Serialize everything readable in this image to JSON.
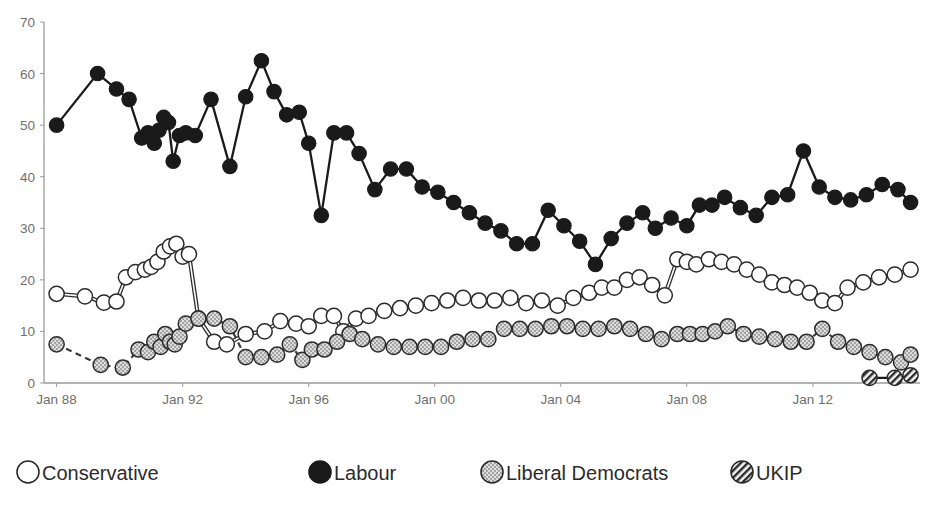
{
  "chart_data": {
    "type": "line",
    "title": "",
    "xlabel": "",
    "ylabel": "",
    "ylim": [
      0,
      70
    ],
    "ytick_labels": [
      "0",
      "10",
      "20",
      "30",
      "40",
      "50",
      "60",
      "70"
    ],
    "yticks": [
      0,
      10,
      20,
      30,
      40,
      50,
      60,
      70
    ],
    "xtick_labels": [
      "Jan 88",
      "Jan 92",
      "Jan 96",
      "Jan 00",
      "Jan 04",
      "Jan 08",
      "Jan 12"
    ],
    "xticks": [
      1988,
      1992,
      1996,
      2000,
      2004,
      2008,
      2012
    ],
    "xlim": [
      1987.6,
      2015.4
    ],
    "grid": false,
    "legend_position": "bottom",
    "series": [
      {
        "name": "Conservative",
        "marker": "open-circle",
        "line_style": "solid-double",
        "color": "#ffffff",
        "edge_color": "#2b2b2b",
        "x": [
          1988.0,
          1988.9,
          1989.5,
          1989.9,
          1990.2,
          1990.5,
          1990.8,
          1991.0,
          1991.2,
          1991.4,
          1991.6,
          1991.8,
          1992.0,
          1992.2,
          1992.5,
          1993.0,
          1993.4,
          1994.0,
          1994.6,
          1995.1,
          1995.6,
          1996.0,
          1996.4,
          1996.8,
          1997.1,
          1997.5,
          1997.9,
          1998.4,
          1998.9,
          1999.4,
          1999.9,
          2000.4,
          2000.9,
          2001.4,
          2001.9,
          2002.4,
          2002.9,
          2003.4,
          2003.9,
          2004.4,
          2004.9,
          2005.3,
          2005.7,
          2006.1,
          2006.5,
          2006.9,
          2007.3,
          2007.7,
          2008.0,
          2008.3,
          2008.7,
          2009.1,
          2009.5,
          2009.9,
          2010.3,
          2010.7,
          2011.1,
          2011.5,
          2011.9,
          2012.3,
          2012.7,
          2013.1,
          2013.6,
          2014.1,
          2014.6,
          2015.1
        ],
        "y": [
          17.3,
          16.8,
          15.6,
          15.8,
          20.5,
          21.5,
          22.0,
          22.5,
          23.5,
          25.5,
          26.5,
          27.0,
          24.5,
          25.0,
          12.5,
          8.0,
          7.5,
          9.5,
          10.0,
          12.0,
          11.5,
          11.0,
          13.0,
          13.0,
          10.0,
          12.5,
          13.0,
          14.0,
          14.5,
          15.0,
          15.5,
          16.0,
          16.5,
          16.0,
          16.0,
          16.5,
          15.5,
          16.0,
          15.0,
          16.5,
          17.5,
          18.5,
          18.5,
          20.0,
          20.5,
          19.0,
          17.0,
          24.0,
          23.5,
          23.0,
          24.0,
          23.5,
          23.0,
          22.0,
          21.0,
          19.5,
          19.0,
          18.5,
          17.5,
          16.0,
          15.5,
          18.5,
          19.5,
          20.5,
          21.0,
          22.0
        ]
      },
      {
        "name": "Labour",
        "marker": "filled-circle",
        "line_style": "solid",
        "color": "#1a1a1a",
        "edge_color": "#1a1a1a",
        "x": [
          1988.0,
          1989.3,
          1989.9,
          1990.3,
          1990.7,
          1990.9,
          1991.1,
          1991.25,
          1991.4,
          1991.55,
          1991.7,
          1991.9,
          1992.1,
          1992.4,
          1992.9,
          1993.5,
          1994.0,
          1994.5,
          1994.9,
          1995.3,
          1995.7,
          1996.0,
          1996.4,
          1996.8,
          1997.2,
          1997.6,
          1998.1,
          1998.6,
          1999.1,
          1999.6,
          2000.1,
          2000.6,
          2001.1,
          2001.6,
          2002.1,
          2002.6,
          2003.1,
          2003.6,
          2004.1,
          2004.6,
          2005.1,
          2005.6,
          2006.1,
          2006.6,
          2007.0,
          2007.5,
          2008.0,
          2008.4,
          2008.8,
          2009.2,
          2009.7,
          2010.2,
          2010.7,
          2011.2,
          2011.7,
          2012.2,
          2012.7,
          2013.2,
          2013.7,
          2014.2,
          2014.7,
          2015.1
        ],
        "y": [
          50.0,
          60.0,
          57.0,
          55.0,
          47.5,
          48.5,
          46.5,
          49.0,
          51.5,
          50.5,
          43.0,
          48.0,
          48.5,
          48.0,
          55.0,
          42.0,
          55.5,
          62.5,
          56.5,
          52.0,
          52.5,
          46.5,
          32.5,
          48.5,
          48.5,
          44.5,
          37.5,
          41.5,
          41.5,
          38.0,
          37.0,
          35.0,
          33.0,
          31.0,
          29.5,
          27.0,
          27.0,
          33.5,
          30.5,
          27.5,
          23.0,
          28.0,
          31.0,
          33.0,
          30.0,
          32.0,
          30.5,
          34.5,
          34.5,
          36.0,
          34.0,
          32.5,
          36.0,
          36.5,
          45.0,
          38.0,
          36.0,
          35.5,
          36.5,
          38.5,
          37.5,
          35.0
        ]
      },
      {
        "name": "Liberal Democrats",
        "marker": "stippled-circle",
        "line_style": "dashed",
        "color": "#c9c9c9",
        "edge_color": "#4a4a4a",
        "x": [
          1988.0,
          1989.4,
          1990.1,
          1990.6,
          1990.9,
          1991.1,
          1991.3,
          1991.45,
          1991.6,
          1991.75,
          1991.9,
          1992.1,
          1992.5,
          1993.0,
          1993.5,
          1994.0,
          1994.5,
          1995.0,
          1995.4,
          1995.8,
          1996.1,
          1996.5,
          1996.9,
          1997.3,
          1997.7,
          1998.2,
          1998.7,
          1999.2,
          1999.7,
          2000.2,
          2000.7,
          2001.2,
          2001.7,
          2002.2,
          2002.7,
          2003.2,
          2003.7,
          2004.2,
          2004.7,
          2005.2,
          2005.7,
          2006.2,
          2006.7,
          2007.2,
          2007.7,
          2008.1,
          2008.5,
          2008.9,
          2009.3,
          2009.8,
          2010.3,
          2010.8,
          2011.3,
          2011.8,
          2012.3,
          2012.8,
          2013.3,
          2013.8,
          2014.3,
          2014.8,
          2015.1
        ],
        "y": [
          7.5,
          3.5,
          3.0,
          6.5,
          6.0,
          8.0,
          7.0,
          9.5,
          8.0,
          7.5,
          9.0,
          11.5,
          12.5,
          12.5,
          11.0,
          5.0,
          5.0,
          5.5,
          7.5,
          4.5,
          6.5,
          6.5,
          8.0,
          9.5,
          8.5,
          7.5,
          7.0,
          7.0,
          7.0,
          7.0,
          8.0,
          8.5,
          8.5,
          10.5,
          10.5,
          10.5,
          11.0,
          11.0,
          10.5,
          10.5,
          11.0,
          10.5,
          9.5,
          8.5,
          9.5,
          9.5,
          9.5,
          10.0,
          11.0,
          9.5,
          9.0,
          8.5,
          8.0,
          8.0,
          10.5,
          8.0,
          7.0,
          6.0,
          5.0,
          4.0,
          5.5
        ]
      },
      {
        "name": "UKIP",
        "marker": "hatched-circle",
        "line_style": "solid",
        "color": "#d0d0d0",
        "edge_color": "#2b2b2b",
        "x": [
          2013.8,
          2014.6,
          2015.1
        ],
        "y": [
          1.0,
          1.0,
          1.5
        ]
      }
    ]
  },
  "legend": {
    "items": [
      {
        "label": "Conservative",
        "marker": "open-circle"
      },
      {
        "label": "Labour",
        "marker": "filled-circle"
      },
      {
        "label": "Liberal Democrats",
        "marker": "stippled-circle"
      },
      {
        "label": "UKIP",
        "marker": "hatched-circle"
      }
    ]
  },
  "colors": {
    "axis": "#9a9a9a",
    "tick_text": "#6f6f6f",
    "labour": "#1a1a1a",
    "conservative": "#ffffff",
    "libdem": "#c9c9c9",
    "ukip": "#d0d0d0",
    "background": "#ffffff"
  }
}
